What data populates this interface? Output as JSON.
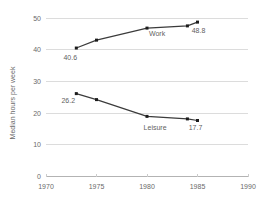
{
  "chart_data": {
    "type": "line",
    "title": "",
    "xlabel": "",
    "ylabel": "Median hours per week",
    "xlim": [
      1970,
      1990
    ],
    "ylim": [
      0,
      50
    ],
    "x_ticks": [
      1970,
      1975,
      1980,
      1985,
      1990
    ],
    "y_ticks": [
      0,
      10,
      20,
      30,
      40,
      50
    ],
    "grid": "horizontal-gridlines",
    "marker": "square",
    "legend_position": "inline-labels",
    "x": [
      1973,
      1975,
      1980,
      1984,
      1985
    ],
    "series": [
      {
        "name": "Work",
        "values": [
          40.6,
          43.1,
          46.9,
          47.6,
          48.8
        ]
      },
      {
        "name": "Leisure",
        "values": [
          26.2,
          24.3,
          19.0,
          18.2,
          17.7
        ]
      }
    ],
    "annotations": [
      {
        "text": "40.6",
        "x": 1972.4,
        "y": 37.6,
        "role": "data-label"
      },
      {
        "text": "Work",
        "x": 1981.0,
        "y": 45.3,
        "role": "series-label"
      },
      {
        "text": "48.8",
        "x": 1985.1,
        "y": 46.0,
        "role": "data-label"
      },
      {
        "text": "26.2",
        "x": 1972.2,
        "y": 24.0,
        "role": "data-label"
      },
      {
        "text": "Leisure",
        "x": 1980.8,
        "y": 15.6,
        "role": "series-label"
      },
      {
        "text": "17.7",
        "x": 1984.8,
        "y": 15.4,
        "role": "data-label"
      }
    ],
    "colors": {
      "background": "#ffffff",
      "line": "#3b3b3b",
      "marker": "#1c1c1c",
      "gridline": "#dcdcdc",
      "axis_line": "#b3b3b3",
      "tick_mark": "#cccccc",
      "tick_label": "#6a6a6a",
      "annotation": "#5f5f5f"
    }
  }
}
